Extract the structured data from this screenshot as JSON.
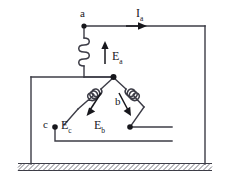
{
  "diagram": {
    "background_color": "#ffffff",
    "wire_color": "#3c3c46",
    "label_color": "#17171c",
    "ground_hatch_color": "#555560"
  },
  "labels": {
    "node_a": "a",
    "node_b": "b",
    "node_c": "c",
    "emf_a_symbol": "E",
    "emf_a_subscript": "a",
    "emf_b_symbol": "E",
    "emf_b_subscript": "b",
    "emf_c_symbol": "E",
    "emf_c_subscript": "c",
    "current_symbol": "I",
    "current_subscript": "a"
  },
  "components": {
    "coil_a_name": "phase-a-winding",
    "coil_b_name": "phase-b-winding",
    "coil_c_name": "phase-c-winding",
    "neutral_node_name": "star-point",
    "ground_name": "earth-ground"
  }
}
